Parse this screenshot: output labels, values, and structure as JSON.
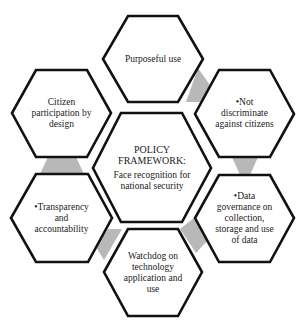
{
  "diagram": {
    "type": "hexagon-cluster",
    "colors": {
      "hex_stroke": "#111111",
      "hex_fill": "#ffffff",
      "connector": "#b8b8b8",
      "text": "#1a1a1a"
    },
    "center": {
      "title_line1": "POLICY",
      "title_line2": "FRAMEWORK:",
      "subtitle_line1": "Face recognition for",
      "subtitle_line2": "national security"
    },
    "nodes": [
      {
        "id": "purposeful-use",
        "lines": [
          "Purposeful use"
        ]
      },
      {
        "id": "not-discriminate",
        "lines": [
          "•Not",
          "discriminate",
          "against citizens"
        ]
      },
      {
        "id": "data-governance",
        "lines": [
          "•Data",
          "governance on",
          "collection,",
          "storage and use",
          "of data"
        ]
      },
      {
        "id": "watchdog",
        "lines": [
          "Watchdog on",
          "technology",
          "application and",
          "use"
        ]
      },
      {
        "id": "transparency",
        "lines": [
          "•Transparency",
          "and",
          "accountability"
        ]
      },
      {
        "id": "citizen-participation",
        "lines": [
          "Citizen",
          "participation by",
          "design"
        ]
      }
    ]
  }
}
